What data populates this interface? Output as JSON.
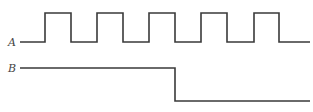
{
  "diagram": {
    "type": "timing-diagram",
    "signals": [
      {
        "name": "A",
        "description": "clock-like square wave, 5 pulses",
        "points": [
          [
            20,
            42
          ],
          [
            45,
            42
          ],
          [
            45,
            13
          ],
          [
            71,
            13
          ],
          [
            71,
            42
          ],
          [
            97,
            42
          ],
          [
            97,
            13
          ],
          [
            123,
            13
          ],
          [
            123,
            42
          ],
          [
            149,
            42
          ],
          [
            149,
            13
          ],
          [
            175,
            13
          ],
          [
            175,
            42
          ],
          [
            201,
            42
          ],
          [
            201,
            13
          ],
          [
            227,
            13
          ],
          [
            227,
            42
          ],
          [
            254,
            42
          ],
          [
            254,
            13
          ],
          [
            279,
            13
          ],
          [
            279,
            42
          ],
          [
            310,
            42
          ]
        ]
      },
      {
        "name": "B",
        "description": "high, then single falling edge aligned with A's third falling edge",
        "points": [
          [
            20,
            68
          ],
          [
            175,
            68
          ],
          [
            175,
            101
          ],
          [
            310,
            101
          ]
        ]
      }
    ],
    "stroke_color": "#3a3a3a",
    "background": "#ffffff"
  }
}
